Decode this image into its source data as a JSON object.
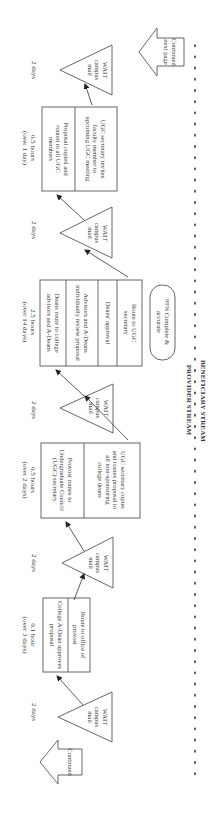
{
  "figure": {
    "orientation": "rotated-90",
    "continued_label": "Continued",
    "continued_next_label": "Continued next page",
    "provider_stream_label": "PROVIDER STREAM",
    "beneficiary_stream_label": "BENEFICIARY STREAM",
    "quality_badge": "99% Complete & accurate",
    "wait_nodes": [
      {
        "line1": "WAIT",
        "line2": "campus",
        "line3": "mail",
        "duration": "2 days"
      },
      {
        "line1": "WAIT",
        "line2": "campus",
        "line3": "mail",
        "duration": "2 days"
      },
      {
        "line1": "WAIT",
        "line2": "campus",
        "line3": "mail",
        "duration": "2 days"
      },
      {
        "line1": "WAIT",
        "line2": "campus",
        "line3": "mail",
        "duration": "2 days"
      },
      {
        "line1": "WAIT",
        "line2": "campus",
        "line3": "mail",
        "duration": "2 days"
      }
    ],
    "process_boxes": [
      {
        "time": "0.1 hour",
        "elapsed": "(over 3 days)",
        "steps": [
          "College A-Dean approves proposal",
          "Route to office of provost"
        ]
      },
      {
        "time": "0.5 hours",
        "elapsed": "(over 2 days)",
        "steps": [
          "Provost routes to Undergraduate Council (UGC) secretary",
          "UGC secretary copies and routes proposal to all non-sponsoring college deans"
        ]
      },
      {
        "time": "2.5 hours",
        "elapsed": "(over 14 days)",
        "steps": [
          "Deans route to college advisors and A-Deans",
          "Advisors and A-Deans individually review proposal",
          "Deans' approval",
          "Route to UGC secretary"
        ]
      },
      {
        "time": "0.5 hours",
        "elapsed": "(over 1 day)",
        "steps": [
          "Proposal copied and routed to all UGC members",
          "UGC secretary invites faculty member to upcoming UGC meeting"
        ]
      }
    ]
  }
}
